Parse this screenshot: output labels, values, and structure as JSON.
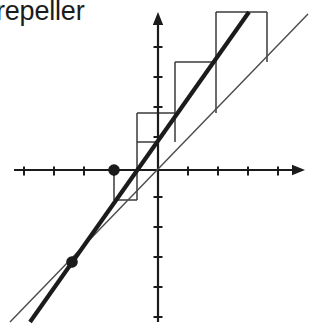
{
  "figure": {
    "caption": "repeller",
    "width": 313,
    "height": 326,
    "background_color": "#ffffff",
    "ink_color": "#1b1b1b",
    "thin_line_color": "#4a4a4a",
    "cobweb_color": "#3a3a3a"
  },
  "chart_data": {
    "type": "line",
    "title": "repeller",
    "subtitle": "",
    "xlabel": "",
    "ylabel": "",
    "grid": false,
    "legend": false,
    "axes": {
      "x_axis": {
        "origin_px": [
          158,
          170
        ],
        "left_end_px": [
          14,
          170
        ],
        "right_end_px": [
          305,
          170
        ],
        "arrow": "right",
        "tick_spacing_px": 30,
        "tick_length_px": 9,
        "tick_positions_px": [
          24,
          54,
          84,
          114,
          188,
          218,
          248,
          278
        ],
        "tick_values": [
          -4.5,
          -3.5,
          -2.5,
          -1.5,
          1,
          2,
          3,
          4
        ],
        "range": [
          -4.8,
          4.9
        ]
      },
      "y_axis": {
        "origin_px": [
          158,
          170
        ],
        "top_end_px": [
          158,
          12
        ],
        "bottom_end_px": [
          158,
          322
        ],
        "arrow": "up",
        "tick_spacing_px": 30,
        "tick_length_px": 9,
        "tick_positions_px": [
          47,
          77,
          107,
          137,
          197,
          227,
          257,
          287,
          317
        ],
        "tick_values": [
          4,
          3,
          2,
          1,
          -1,
          -2,
          -3,
          -4,
          -5
        ],
        "range": [
          -5.1,
          5.3
        ]
      }
    },
    "series": [
      {
        "name": "map-line",
        "label": "f(x) — thick line, slope > 1",
        "type": "line",
        "style": "thick",
        "stroke_width_px": 4.2,
        "color": "#1b1b1b",
        "endpoints_px": [
          [
            30,
            322
          ],
          [
            249,
            12
          ]
        ],
        "slope_px": -1.416,
        "fixed_points_crossed": 2
      },
      {
        "name": "identity-line",
        "label": "y = x — thin diagonal",
        "type": "line",
        "style": "thin",
        "stroke_width_px": 1.4,
        "color": "#4a4a4a",
        "endpoints_px": [
          [
            10,
            322
          ],
          [
            308,
            14
          ]
        ],
        "slope_px": -1.033
      }
    ],
    "fixed_points": [
      {
        "name": "repelling-fixed-point-right",
        "px": [
          114,
          170
        ],
        "radius_px": 5.2,
        "filled": true,
        "color": "#1b1b1b",
        "note": "intersection of the two lines, on the x-axis"
      },
      {
        "name": "repelling-fixed-point-left",
        "px": [
          72,
          262
        ],
        "radius_px": 5.2,
        "filled": true,
        "color": "#1b1b1b",
        "note": "lower-left intersection of the two lines"
      }
    ],
    "cobweb": {
      "name": "staircase-orbit",
      "stroke_width_px": 1.5,
      "color": "#3a3a3a",
      "direction": "outward (repelling)",
      "segments_px": [
        [
          [
            114,
            170
          ],
          [
            114,
            200
          ]
        ],
        [
          [
            114,
            200
          ],
          [
            137,
            200
          ]
        ],
        [
          [
            137,
            200
          ],
          [
            137,
            170
          ]
        ],
        [
          [
            137,
            170
          ],
          [
            137,
            142
          ]
        ],
        [
          [
            137,
            142
          ],
          [
            158,
            142
          ]
        ],
        [
          [
            158,
            142
          ],
          [
            158,
            170
          ]
        ],
        [
          [
            137,
            142
          ],
          [
            137,
            113
          ]
        ],
        [
          [
            137,
            113
          ],
          [
            175,
            113
          ]
        ],
        [
          [
            175,
            113
          ],
          [
            175,
            142
          ]
        ],
        [
          [
            175,
            113
          ],
          [
            175,
            62
          ]
        ],
        [
          [
            175,
            62
          ],
          [
            216,
            62
          ]
        ],
        [
          [
            216,
            62
          ],
          [
            216,
            113
          ]
        ],
        [
          [
            216,
            62
          ],
          [
            216,
            12
          ]
        ],
        [
          [
            216,
            12
          ],
          [
            267,
            12
          ]
        ],
        [
          [
            267,
            12
          ],
          [
            267,
            62
          ]
        ]
      ]
    }
  }
}
